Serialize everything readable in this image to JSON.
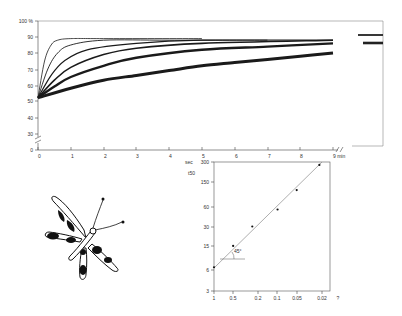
{
  "chart_data": [
    {
      "type": "line",
      "title": "",
      "xlabel": "min",
      "ylabel": "%",
      "xlim": [
        0,
        9
      ],
      "ylim": [
        0,
        100
      ],
      "y_axis_break": "between 0 and 30",
      "x_axis_break": "after 9 min",
      "x_ticks": [
        "0",
        "1",
        "2",
        "3",
        "4",
        "5",
        "6",
        "7",
        "8",
        "9 min"
      ],
      "y_ticks": [
        "0",
        "30",
        "40",
        "50",
        "60",
        "70",
        "80",
        "90",
        "100 %"
      ],
      "grid": false,
      "series": [
        {
          "name": "curve 1 (fastest)",
          "x": [
            0,
            0.2,
            0.4,
            0.6,
            1,
            2,
            5
          ],
          "values": [
            52,
            75,
            85,
            88,
            89,
            89,
            89
          ]
        },
        {
          "name": "curve 2",
          "x": [
            0,
            0.3,
            0.6,
            1,
            2,
            4,
            7
          ],
          "values": [
            52,
            70,
            80,
            85,
            88,
            88,
            88
          ]
        },
        {
          "name": "curve 3",
          "x": [
            0,
            0.4,
            0.8,
            1.5,
            3,
            5,
            9
          ],
          "values": [
            52,
            66,
            75,
            82,
            86,
            88,
            88
          ]
        },
        {
          "name": "curve 4",
          "x": [
            0,
            0.5,
            1,
            2,
            3,
            5,
            9
          ],
          "values": [
            52,
            63,
            71,
            79,
            83,
            86,
            88
          ]
        },
        {
          "name": "curve 5",
          "x": [
            0,
            0.5,
            1,
            2,
            3,
            5,
            7,
            9
          ],
          "values": [
            52,
            59,
            65,
            72,
            77,
            82,
            84,
            86
          ]
        },
        {
          "name": "curve 6 (slowest)",
          "x": [
            0,
            1,
            2,
            3,
            4,
            5,
            6,
            7,
            8,
            9
          ],
          "values": [
            52,
            58,
            63,
            66,
            69,
            72,
            74,
            76,
            78,
            80
          ]
        }
      ],
      "after_break_plateaus": [
        90,
        88
      ]
    },
    {
      "type": "scatter",
      "title": "",
      "xlabel": "",
      "ylabel": "t50 (sec)",
      "x_scale": "log (reversed)",
      "y_scale": "log",
      "x_ticks": [
        "1",
        "0.5",
        "0.2",
        "0.1",
        "0.05",
        "0.02",
        "?"
      ],
      "y_ticks": [
        "3",
        "6",
        "15",
        "30",
        "60",
        "150",
        "300"
      ],
      "y_unit": "sec",
      "annotation": "45°",
      "points": [
        {
          "x": 1,
          "y": 7
        },
        {
          "x": 0.5,
          "y": 15
        },
        {
          "x": 0.25,
          "y": 30
        },
        {
          "x": 0.1,
          "y": 55
        },
        {
          "x": 0.05,
          "y": 110
        },
        {
          "x": 0.022,
          "y": 270
        }
      ],
      "fit_line": "slope 45° through points"
    }
  ],
  "main_chart": {
    "y_labels": [
      {
        "text": "100 %",
        "y": 21
      },
      {
        "text": "90",
        "y": 37
      },
      {
        "text": "80",
        "y": 53
      },
      {
        "text": "70",
        "y": 70
      },
      {
        "text": "60",
        "y": 86
      },
      {
        "text": "50",
        "y": 101
      },
      {
        "text": "40",
        "y": 118
      },
      {
        "text": "30",
        "y": 134
      },
      {
        "text": "0",
        "y": 150
      }
    ],
    "x_labels": [
      {
        "text": "0",
        "x": 38
      },
      {
        "text": "1",
        "x": 71
      },
      {
        "text": "2",
        "x": 104
      },
      {
        "text": "3",
        "x": 136
      },
      {
        "text": "4",
        "x": 169
      },
      {
        "text": "5",
        "x": 202
      },
      {
        "text": "6",
        "x": 235
      },
      {
        "text": "7",
        "x": 268
      },
      {
        "text": "8",
        "x": 300
      },
      {
        "text": "9 min",
        "x": 333
      }
    ]
  },
  "inset_chart": {
    "y_unit_label": "sec",
    "y_axis_label": "t50",
    "y_labels": [
      {
        "text": "300",
        "y": 162
      },
      {
        "text": "150",
        "y": 182
      },
      {
        "text": "60",
        "y": 207
      },
      {
        "text": "30",
        "y": 227
      },
      {
        "text": "15",
        "y": 246
      },
      {
        "text": "6",
        "y": 270
      },
      {
        "text": "3",
        "y": 291
      }
    ],
    "x_labels": [
      {
        "text": "1",
        "x": 214
      },
      {
        "text": "0.5",
        "x": 233
      },
      {
        "text": "0.2",
        "x": 258
      },
      {
        "text": "0.1",
        "x": 277
      },
      {
        "text": "0.05",
        "x": 297
      },
      {
        "text": "0.02",
        "x": 322
      },
      {
        "text": "?",
        "x": 338
      }
    ],
    "angle_label": "45°"
  },
  "illustration": {
    "subject": "moth (Zygaena-like, black-spotted wings)"
  }
}
